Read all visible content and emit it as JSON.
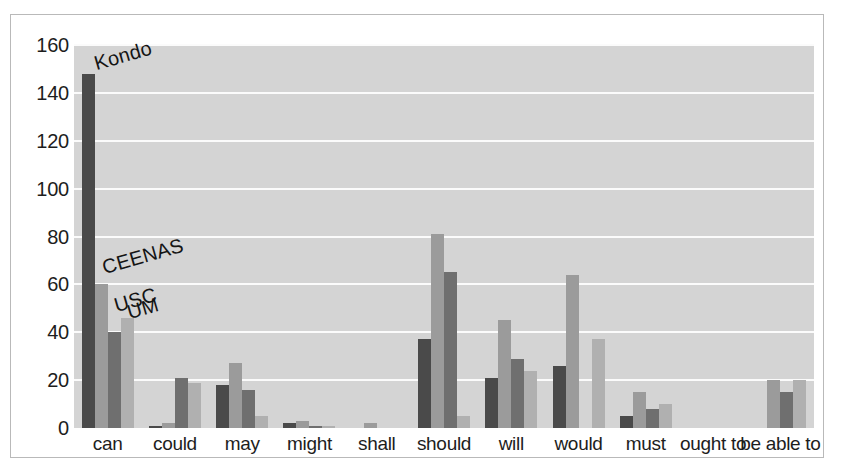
{
  "chart_data": {
    "type": "bar",
    "title": "",
    "subtitle": "",
    "xlabel": "",
    "ylabel": "",
    "ylim": [
      0,
      160
    ],
    "ytick_step": 20,
    "yticks": [
      0,
      20,
      40,
      60,
      80,
      100,
      120,
      140,
      160
    ],
    "grid": true,
    "grid_orientation": "horizontal",
    "legend_position": "inline-annotations",
    "categories": [
      "can",
      "could",
      "may",
      "might",
      "shall",
      "should",
      "will",
      "would",
      "must",
      "ought to",
      "be able to"
    ],
    "series": [
      {
        "name": "Kondo",
        "color": "#4a4a4a",
        "values": [
          148,
          1,
          18,
          2,
          0,
          37,
          21,
          26,
          5,
          0,
          0
        ]
      },
      {
        "name": "CEENAS",
        "color": "#9b9b9b",
        "values": [
          60,
          2,
          27,
          3,
          2,
          81,
          45,
          64,
          15,
          0,
          20
        ]
      },
      {
        "name": "USC",
        "color": "#6f6f6f",
        "values": [
          40,
          21,
          16,
          1,
          0,
          65,
          29,
          0,
          8,
          0,
          15
        ]
      },
      {
        "name": "UM",
        "color": "#b0b0b0",
        "values": [
          46,
          19,
          5,
          1,
          0,
          5,
          24,
          37,
          10,
          0,
          20
        ]
      }
    ],
    "annotations": [
      {
        "text": "Kondo",
        "series": "Kondo",
        "rotation": -16
      },
      {
        "text": "CEENAS",
        "series": "CEENAS",
        "rotation": -16
      },
      {
        "text": "USC",
        "series": "USC",
        "rotation": -16
      },
      {
        "text": "UM",
        "series": "UM",
        "rotation": -16
      }
    ],
    "colors": {
      "plot_background": "#d4d4d4",
      "gridline": "#fbfbfb",
      "frame_border": "#b9b9b9",
      "text": "#1d1d1d",
      "page_background": "#ffffff"
    }
  }
}
